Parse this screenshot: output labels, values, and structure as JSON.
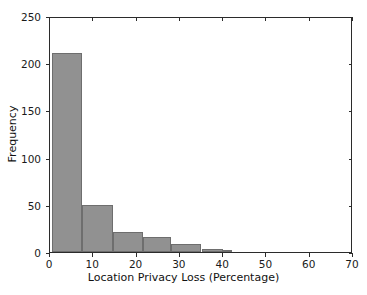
{
  "chart_data": {
    "type": "bar",
    "title": "",
    "subtitle": "",
    "xlabel": "Location Privacy Loss (Percentage)",
    "ylabel": "Frequency",
    "xlim": [
      0,
      70
    ],
    "ylim": [
      0,
      250
    ],
    "xticks": [
      0,
      10,
      20,
      30,
      40,
      50,
      60,
      70
    ],
    "yticks": [
      0,
      50,
      100,
      150,
      200,
      250
    ],
    "xtick_labels": [
      "0",
      "10",
      "20",
      "30",
      "40",
      "50",
      "60",
      "70"
    ],
    "ytick_labels": [
      "0",
      "50",
      "100",
      "150",
      "200",
      "250"
    ],
    "grid": false,
    "legend": null,
    "legend_position": "none",
    "bar_color": "#919191",
    "bar_edge_color": "#6e6e6e",
    "axis_color": "#2b2b2b",
    "background_color": "#ffffff",
    "annotations": [],
    "bins": [
      {
        "label": "0.5-7.5",
        "x0": 0.5,
        "x1": 7.5,
        "value": 211
      },
      {
        "label": "7.5-14.5",
        "x0": 7.5,
        "x1": 14.5,
        "value": 50
      },
      {
        "label": "14.5-21.5",
        "x0": 14.5,
        "x1": 21.5,
        "value": 21
      },
      {
        "label": "21.5-28.0",
        "x0": 21.5,
        "x1": 28.0,
        "value": 16
      },
      {
        "label": "28.0-35.0",
        "x0": 28.0,
        "x1": 35.0,
        "value": 9
      },
      {
        "label": "35.0-40.0",
        "x0": 35.0,
        "x1": 40.0,
        "value": 3
      },
      {
        "label": "40.0-42.0",
        "x0": 40.0,
        "x1": 42.0,
        "value": 1
      }
    ],
    "categories": [
      "0.5-7.5",
      "7.5-14.5",
      "14.5-21.5",
      "21.5-28.0",
      "28.0-35.0",
      "35.0-40.0",
      "40.0-42.0"
    ],
    "values": [
      211,
      50,
      21,
      16,
      9,
      3,
      1
    ]
  }
}
